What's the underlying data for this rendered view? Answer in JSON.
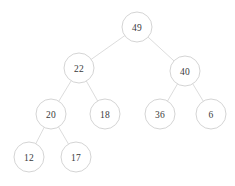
{
  "figure": {
    "width": 235,
    "height": 186,
    "background_color": "#ffffff",
    "node_fill_color": "#ffffff",
    "node_stroke_color": "#cfcfcf",
    "edge_color": "#d8d8d8",
    "label_color": "#3a3a3a",
    "node_radius": 15
  },
  "chart_data": {
    "type": "diagram",
    "diagram_type": "binary-tree",
    "root": "49",
    "nodes": [
      {
        "id": "n49",
        "label": "49",
        "cx": 137,
        "cy": 27,
        "r": 15,
        "depth": 0
      },
      {
        "id": "n22",
        "label": "22",
        "cx": 79,
        "cy": 68,
        "r": 15,
        "depth": 1
      },
      {
        "id": "n40",
        "label": "40",
        "cx": 185,
        "cy": 71,
        "r": 15,
        "depth": 1
      },
      {
        "id": "n20",
        "label": "20",
        "cx": 51,
        "cy": 114,
        "r": 15,
        "depth": 2
      },
      {
        "id": "n18",
        "label": "18",
        "cx": 105,
        "cy": 114,
        "r": 15,
        "depth": 2
      },
      {
        "id": "n36",
        "label": "36",
        "cx": 160,
        "cy": 114,
        "r": 15,
        "depth": 2
      },
      {
        "id": "n6",
        "label": "6",
        "cx": 211,
        "cy": 114,
        "r": 15,
        "depth": 2
      },
      {
        "id": "n12",
        "label": "12",
        "cx": 29,
        "cy": 157,
        "r": 15,
        "depth": 3
      },
      {
        "id": "n17",
        "label": "17",
        "cx": 76,
        "cy": 157,
        "r": 15,
        "depth": 3
      }
    ],
    "edges": [
      {
        "from": "n49",
        "to": "n22",
        "side": "left"
      },
      {
        "from": "n49",
        "to": "n40",
        "side": "right"
      },
      {
        "from": "n22",
        "to": "n20",
        "side": "left"
      },
      {
        "from": "n22",
        "to": "n18",
        "side": "right"
      },
      {
        "from": "n40",
        "to": "n36",
        "side": "left"
      },
      {
        "from": "n40",
        "to": "n6",
        "side": "right"
      },
      {
        "from": "n20",
        "to": "n12",
        "side": "left"
      },
      {
        "from": "n20",
        "to": "n17",
        "side": "right"
      }
    ]
  }
}
